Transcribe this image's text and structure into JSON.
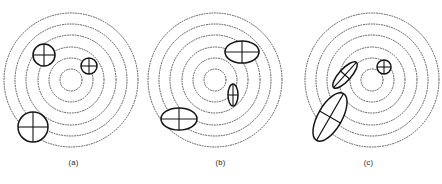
{
  "figure": {
    "background_color": "#ffffff",
    "ring_color": "#4a4a4a",
    "marker_color": "#141414",
    "ring_style": "dotted",
    "width": 442,
    "height": 184
  },
  "panels": [
    {
      "id": "panel-a",
      "caption": "(a)",
      "origin_x": 0,
      "center": {
        "x": 71,
        "y": 80
      },
      "rings": [
        {
          "r": 11
        },
        {
          "r": 22
        },
        {
          "r": 33
        },
        {
          "r": 45
        },
        {
          "r": 56
        },
        {
          "r": 67
        }
      ],
      "markers": [
        {
          "name": "marker-upper-left",
          "cx": 44,
          "cy": 55,
          "rx": 11,
          "ry": 11,
          "angle": 0,
          "shape": "circle"
        },
        {
          "name": "marker-right",
          "cx": 89,
          "cy": 66,
          "rx": 8,
          "ry": 8,
          "angle": 0,
          "shape": "circle"
        },
        {
          "name": "marker-lower-left",
          "cx": 33,
          "cy": 127,
          "rx": 15,
          "ry": 15,
          "angle": 0,
          "shape": "circle"
        }
      ]
    },
    {
      "id": "panel-b",
      "caption": "(b)",
      "origin_x": 147,
      "center": {
        "x": 68,
        "y": 80
      },
      "rings": [
        {
          "r": 11
        },
        {
          "r": 22
        },
        {
          "r": 33
        },
        {
          "r": 45
        },
        {
          "r": 56
        },
        {
          "r": 67
        }
      ],
      "markers": [
        {
          "name": "marker-upper-right",
          "cx": 95,
          "cy": 52,
          "rx": 17,
          "ry": 11,
          "angle": 0,
          "shape": "ellipse"
        },
        {
          "name": "marker-center-right",
          "cx": 86,
          "cy": 95,
          "rx": 5,
          "ry": 11,
          "angle": 0,
          "shape": "ellipse"
        },
        {
          "name": "marker-lower-left",
          "cx": 32,
          "cy": 119,
          "rx": 18,
          "ry": 11,
          "angle": 0,
          "shape": "ellipse"
        }
      ]
    },
    {
      "id": "panel-c",
      "caption": "(c)",
      "origin_x": 295,
      "center": {
        "x": 77,
        "y": 80
      },
      "rings": [
        {
          "r": 11
        },
        {
          "r": 22
        },
        {
          "r": 33
        },
        {
          "r": 45
        },
        {
          "r": 56
        },
        {
          "r": 67
        }
      ],
      "markers": [
        {
          "name": "marker-inner-tilted",
          "cx": 50,
          "cy": 75,
          "rx": 17,
          "ry": 6,
          "angle": -48,
          "shape": "ellipse"
        },
        {
          "name": "marker-outer-tilted",
          "cx": 35,
          "cy": 117,
          "rx": 27,
          "ry": 12,
          "angle": -60,
          "shape": "ellipse"
        },
        {
          "name": "marker-small-circle",
          "cx": 89,
          "cy": 67,
          "rx": 7,
          "ry": 7,
          "angle": 0,
          "shape": "circle"
        }
      ]
    }
  ]
}
